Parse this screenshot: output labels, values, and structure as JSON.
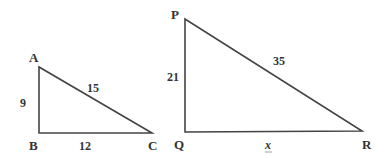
{
  "diagram": {
    "type": "similar-right-triangles",
    "colors": {
      "stroke": "#444444",
      "text": "#333333",
      "background": "#ffffff"
    },
    "triangles": [
      {
        "name": "triangle-abc",
        "vertices": {
          "A": {
            "label": "A",
            "x": 39,
            "y": 67
          },
          "B": {
            "label": "B",
            "x": 39,
            "y": 133
          },
          "C": {
            "label": "C",
            "x": 152,
            "y": 133
          }
        },
        "sides": {
          "AB": {
            "label": "9"
          },
          "BC": {
            "label": "12"
          },
          "AC": {
            "label": "15"
          }
        }
      },
      {
        "name": "triangle-pqr",
        "vertices": {
          "P": {
            "label": "P",
            "x": 185,
            "y": 19
          },
          "Q": {
            "label": "Q",
            "x": 185,
            "y": 132
          },
          "R": {
            "label": "R",
            "x": 362,
            "y": 131
          }
        },
        "sides": {
          "PQ": {
            "label": "21"
          },
          "QR": {
            "label": "x"
          },
          "PR": {
            "label": "35"
          }
        }
      }
    ]
  }
}
